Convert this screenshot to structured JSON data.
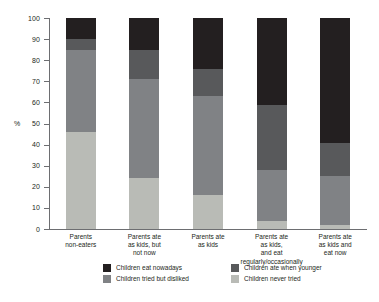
{
  "chart_data": {
    "type": "bar",
    "subtype": "stacked-100",
    "title": "",
    "xlabel": "",
    "ylabel": "%",
    "ylim": [
      0,
      100
    ],
    "yticks": [
      0,
      10,
      20,
      30,
      40,
      50,
      60,
      70,
      80,
      90,
      100
    ],
    "grid": false,
    "legend_position": "bottom",
    "categories": [
      "Parents\nnon-eaters",
      "Parents ate\nas kids, but\nnot now",
      "Parents ate\nas kids",
      "Parents ate\nas kids,\nand eat\nregularly/occasionally",
      "Parents ate\nas kids and\neat now"
    ],
    "category_lines": [
      [
        "Parents",
        "non-eaters"
      ],
      [
        "Parents ate",
        "as kids, but",
        "not now"
      ],
      [
        "Parents ate",
        "as kids"
      ],
      [
        "Parents ate",
        "as kids,",
        "and eat",
        "regularly/occasionally"
      ],
      [
        "Parents ate",
        "as kids and",
        "eat now"
      ]
    ],
    "series": [
      {
        "name": "Children never tried",
        "color": "#b9bbb6",
        "values": [
          46,
          24,
          16,
          4,
          2
        ]
      },
      {
        "name": "Children tried but disliked",
        "color": "#808285",
        "values": [
          39,
          47,
          47,
          24,
          23
        ]
      },
      {
        "name": "Children ate when younger",
        "color": "#58595b",
        "values": [
          5,
          14,
          13,
          31,
          16
        ]
      },
      {
        "name": "Children eat nowadays",
        "color": "#231f20",
        "values": [
          10,
          15,
          24,
          41,
          59
        ]
      }
    ],
    "stack_order_bottom_to_top": [
      "Children never tried",
      "Children tried but disliked",
      "Children ate when younger",
      "Children eat nowadays"
    ]
  },
  "legend": {
    "entries": [
      {
        "label": "Children eat nowadays",
        "color": "#231f20"
      },
      {
        "label": "Children ate when younger",
        "color": "#58595b"
      },
      {
        "label": "Children tried but disliked",
        "color": "#808285"
      },
      {
        "label": "Children never tried",
        "color": "#b9bbb6"
      }
    ]
  },
  "colors": {
    "axis": "#6d6e71",
    "text": "#231f20",
    "background": "#ffffff"
  }
}
